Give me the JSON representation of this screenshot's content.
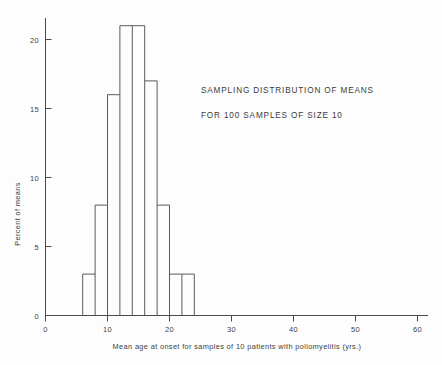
{
  "chart_data": {
    "type": "bar",
    "title": "",
    "subtitle": "",
    "xlabel": "Mean age at onset for samples of 10 patients with poliomyelitis (yrs.)",
    "ylabel": "Percent of means",
    "xlim": [
      0,
      66
    ],
    "ylim": [
      0,
      22
    ],
    "grid": false,
    "legend": null,
    "bin_width": 2,
    "bin_edges": [
      6,
      8,
      10,
      12,
      14,
      16,
      18,
      20,
      22,
      24
    ],
    "categories": [
      "6-8",
      "8-10",
      "10-12",
      "12-14",
      "14-16",
      "16-18",
      "18-20",
      "20-22",
      "22-24"
    ],
    "bin_centers": [
      7,
      9,
      11,
      13,
      15,
      17,
      19,
      21,
      23
    ],
    "values": [
      3,
      8,
      16,
      21,
      21,
      17,
      8,
      3,
      3
    ],
    "total_percent": 100,
    "xticks": [
      0,
      10,
      20,
      30,
      40,
      50,
      60
    ],
    "xtick_labels": [
      "0",
      "10",
      "20",
      "30",
      "40",
      "50",
      "60"
    ],
    "yticks": [
      0,
      5,
      10,
      15,
      20
    ],
    "ytick_labels": [
      "0",
      "5",
      "10",
      "15",
      "20"
    ],
    "annotations": [
      "SAMPLING DISTRIBUTION OF MEANS",
      "FOR 100 SAMPLES OF SIZE 10"
    ],
    "colors": {
      "background": "#fdfdfd",
      "axis": "#4a4a4a",
      "bar_outline": "#5a5a5a",
      "text": "#3d3d3d"
    }
  },
  "annotation_block": {
    "line1": "SAMPLING DISTRIBUTION OF MEANS",
    "line2": "FOR 100 SAMPLES OF SIZE 10"
  },
  "axes": {
    "x_title": "Mean age at onset for samples of 10 patients with poliomyelitis (yrs.)",
    "y_title": "Percent of means",
    "x_origin_label": "0",
    "y_origin_label": "0"
  },
  "x_tick_labels": {
    "t0": "0",
    "t1": "10",
    "t2": "20",
    "t3": "30",
    "t4": "40",
    "t5": "50",
    "t6": "60"
  },
  "y_tick_labels": {
    "t0": "0",
    "t1": "5",
    "t2": "10",
    "t3": "15",
    "t4": "20"
  }
}
